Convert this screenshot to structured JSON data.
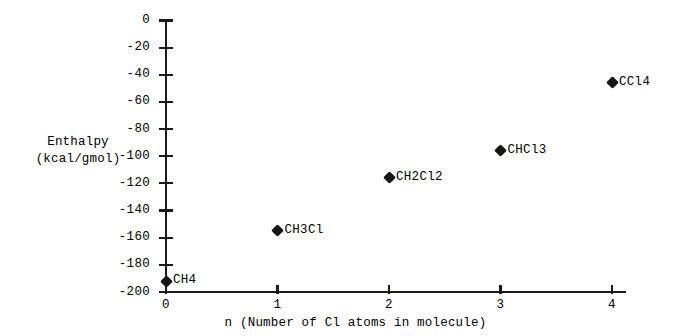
{
  "chart_data": {
    "type": "scatter",
    "title": "",
    "xlabel": "n (Number of Cl atoms in molecule)",
    "ylabel_lines": [
      "Enthalpy",
      "(kcal/gmol)"
    ],
    "ylabel": "Enthalpy (kcal/gmol)",
    "xlim": [
      0,
      4
    ],
    "ylim": [
      -200,
      0
    ],
    "xticks": [
      "0",
      "1",
      "2",
      "3",
      "4"
    ],
    "yticks": [
      "0",
      "-20",
      "-40",
      "-60",
      "-80",
      "-100",
      "-120",
      "-140",
      "-160",
      "-180",
      "-200"
    ],
    "grid": false,
    "legend": false,
    "marker_color": "#151515",
    "axis_color": "#1a1a1a",
    "background_color": "#ffffff",
    "x": [
      0,
      1,
      2,
      3,
      4
    ],
    "values": [
      -192,
      -155,
      -116,
      -96,
      -46
    ],
    "point_labels": [
      "CH4",
      "CH3Cl",
      "CH2Cl2",
      "CHCl3",
      "CCl4"
    ],
    "points": [
      {
        "x": 0,
        "y": -192,
        "label": "CH4"
      },
      {
        "x": 1,
        "y": -155,
        "label": "CH3Cl"
      },
      {
        "x": 2,
        "y": -116,
        "label": "CH2Cl2"
      },
      {
        "x": 3,
        "y": -96,
        "label": "CHCl3"
      },
      {
        "x": 4,
        "y": -46,
        "label": "CCl4"
      }
    ]
  }
}
